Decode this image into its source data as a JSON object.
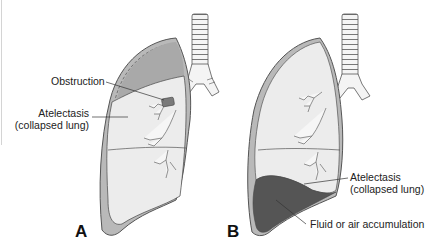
{
  "figure": {
    "panels": [
      {
        "id": "A",
        "letter": "A",
        "labels": {
          "obstruction": "Obstruction",
          "atelectasis_line1": "Atelectasis",
          "atelectasis_line2": "(collapsed lung)"
        }
      },
      {
        "id": "B",
        "letter": "B",
        "labels": {
          "atelectasis_line1": "Atelectasis",
          "atelectasis_line2": "(collapsed lung)",
          "fluid": "Fluid or air accumulation"
        }
      }
    ],
    "colors": {
      "pleura_outline": "#555555",
      "pleura_fill": "#b9b9b9",
      "pleural_space_air": "#a9a9a9",
      "lung_fill": "#ececec",
      "fluid_fill": "#555555",
      "obstruction_fill": "#7a7a7a",
      "trachea_fill": "#f4f4f4"
    }
  }
}
